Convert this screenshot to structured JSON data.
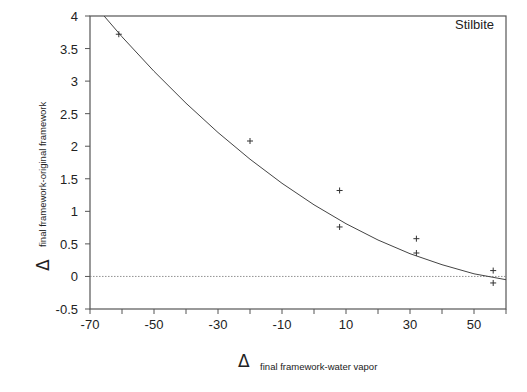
{
  "chart_data": {
    "type": "scatter",
    "title": "",
    "annotation": "Stilbite",
    "xlabel_symbol": "Δ",
    "xlabel": "final framework-water vapor",
    "ylabel_symbol": "Δ",
    "ylabel": "final framework-original framework",
    "xlim": [
      -70,
      60
    ],
    "ylim": [
      -0.5,
      4
    ],
    "x_ticks": [
      -70,
      -60,
      -50,
      -40,
      -30,
      -20,
      -10,
      0,
      10,
      20,
      30,
      40,
      50,
      60
    ],
    "x_tick_labels": [
      "-70",
      "-50",
      "-30",
      "-10",
      "10",
      "30",
      "50"
    ],
    "x_tick_label_values": [
      -70,
      -50,
      -30,
      -10,
      10,
      30,
      50
    ],
    "y_ticks": [
      -0.5,
      0,
      0.5,
      1,
      1.5,
      2,
      2.5,
      3,
      3.5,
      4
    ],
    "y_tick_labels": [
      "-0.5",
      "0",
      "0.5",
      "1",
      "1.5",
      "2",
      "2.5",
      "3",
      "3.5",
      "4"
    ],
    "grid": false,
    "reference_line": {
      "y": 0,
      "style": "dotted"
    },
    "series": [
      {
        "name": "measured",
        "marker": "+",
        "points": [
          {
            "x": -61,
            "y": 3.72
          },
          {
            "x": -20,
            "y": 2.08
          },
          {
            "x": 8,
            "y": 1.32
          },
          {
            "x": 8,
            "y": 0.76
          },
          {
            "x": 32,
            "y": 0.58
          },
          {
            "x": 32,
            "y": 0.36
          },
          {
            "x": 56,
            "y": 0.09
          },
          {
            "x": 56,
            "y": -0.1
          }
        ]
      },
      {
        "name": "fit",
        "type": "line",
        "points": [
          {
            "x": -65.6,
            "y": 4.0
          },
          {
            "x": -60,
            "y": 3.68
          },
          {
            "x": -50,
            "y": 3.15
          },
          {
            "x": -40,
            "y": 2.66
          },
          {
            "x": -30,
            "y": 2.21
          },
          {
            "x": -20,
            "y": 1.8
          },
          {
            "x": -10,
            "y": 1.43
          },
          {
            "x": 0,
            "y": 1.1
          },
          {
            "x": 10,
            "y": 0.81
          },
          {
            "x": 20,
            "y": 0.56
          },
          {
            "x": 30,
            "y": 0.35
          },
          {
            "x": 40,
            "y": 0.18
          },
          {
            "x": 50,
            "y": 0.04
          },
          {
            "x": 60,
            "y": -0.05
          }
        ]
      }
    ]
  }
}
